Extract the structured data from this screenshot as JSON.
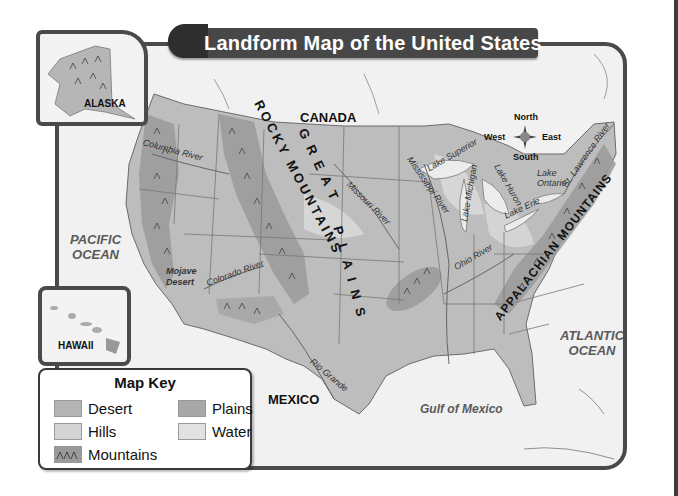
{
  "title": "Landform Map of the United States",
  "insets": {
    "alaska": "ALASKA",
    "hawaii": "HAWAII"
  },
  "countries": {
    "canada": "CANADA",
    "mexico": "MEXICO"
  },
  "water_bodies": {
    "pacific_line1": "PACIFIC",
    "pacific_line2": "OCEAN",
    "atlantic_line1": "ATLANTIC",
    "atlantic_line2": "OCEAN",
    "gulf": "Gulf of Mexico",
    "lake_superior": "Lake Superior",
    "lake_michigan": "Lake Michigan",
    "lake_huron": "Lake Huron",
    "lake_ontario_line1": "Lake",
    "lake_ontario_line2": "Ontario",
    "lake_erie": "Lake Erie"
  },
  "rivers": {
    "columbia": "Columbia River",
    "colorado": "Colorado River",
    "missouri": "Missouri River",
    "mississippi": "Mississippi River",
    "ohio": "Ohio River",
    "st_lawrence": "St. Lawrence River",
    "rio_grande": "Rio Grande"
  },
  "landforms": {
    "rocky_line1": "ROCKY",
    "rocky_line2": "MOUNTAINS",
    "great": "GREAT",
    "plains": "PLAINS",
    "appalachian": "APPALACHIAN MOUNTAINS",
    "mojave_line1": "Mojave",
    "mojave_line2": "Desert"
  },
  "compass": {
    "north": "North",
    "south": "South",
    "east": "East",
    "west": "West"
  },
  "map_key": {
    "title": "Map Key",
    "items": [
      {
        "label": "Desert",
        "color": "#b4b4b4"
      },
      {
        "label": "Plains",
        "color": "#a8a8a8"
      },
      {
        "label": "Hills",
        "color": "#d4d4d4"
      },
      {
        "label": "Water",
        "color": "#e2e2e2"
      },
      {
        "label": "Mountains",
        "color": "#9a9a9a"
      }
    ]
  },
  "colors": {
    "land": "#bdbdbd",
    "mountain": "#9a9a9a",
    "hills": "#d6d6d6",
    "water": "#f1f1f1",
    "border": "#4a4a4a"
  }
}
